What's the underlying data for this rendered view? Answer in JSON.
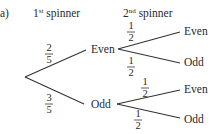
{
  "part_label": "a)",
  "headers": {
    "first": {
      "base": "1",
      "sup": "st",
      "rest": " spinner"
    },
    "second": {
      "base": "2",
      "sup": "nd",
      "rest": " spinner"
    }
  },
  "tree": {
    "stage1": [
      {
        "outcome": "Even",
        "prob": {
          "num": "2",
          "den": "5"
        }
      },
      {
        "outcome": "Odd",
        "prob": {
          "num": "3",
          "den": "5"
        }
      }
    ],
    "stage2": {
      "Even": [
        {
          "outcome": "Even",
          "prob": {
            "num": "1",
            "den": "2"
          }
        },
        {
          "outcome": "Odd",
          "prob": {
            "num": "1",
            "den": "2"
          }
        }
      ],
      "Odd": [
        {
          "outcome": "Even",
          "prob": {
            "num": "1",
            "den": "2"
          }
        },
        {
          "outcome": "Odd",
          "prob": {
            "num": "1",
            "den": "2"
          }
        }
      ]
    }
  }
}
